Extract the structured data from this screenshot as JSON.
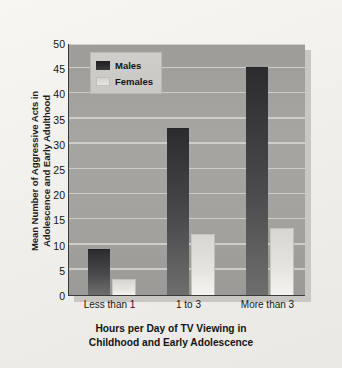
{
  "chart_data": {
    "type": "bar",
    "title": "",
    "subtitle": "",
    "xlabel_lines": [
      "Hours per Day of TV Viewing in",
      "Childhood and Early Adolescence"
    ],
    "ylabel_lines": [
      "Mean Number of Aggressive Acts in",
      "Adolescence and Early Adulthood"
    ],
    "categories": [
      "Less than 1",
      "1 to 3",
      "More than 3"
    ],
    "series": [
      {
        "name": "Males",
        "values": [
          9,
          33,
          45
        ],
        "color": "#2f2f31"
      },
      {
        "name": "Females",
        "values": [
          3,
          12,
          13
        ],
        "color": "#e2e0db"
      }
    ],
    "ylim": [
      0,
      50
    ],
    "ytick_step": 5,
    "yticks": [
      0,
      5,
      10,
      15,
      20,
      25,
      30,
      35,
      40,
      45,
      50
    ],
    "grid": true,
    "grid_axis": "y",
    "legend_position": "upper left (inside plot area)",
    "legend_entries": [
      "Males",
      "Females"
    ],
    "plot_background_color": "#a3a29e",
    "gridline_color": "#d6d5d1",
    "figure_background_color": "#efeeea",
    "axis_color": "#3a3a3a"
  }
}
